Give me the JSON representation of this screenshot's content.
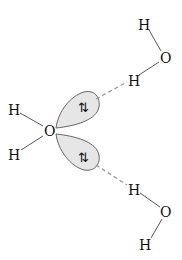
{
  "diagram": {
    "type": "hydrogen-bonding",
    "colors": {
      "lobe_fill": "#e6e6e6",
      "lobe_stroke": "#555555",
      "bond": "#555555",
      "hydrogen_bond": "#9a9a9a",
      "text": "#111111"
    },
    "central_water": {
      "oxygen": "O",
      "h_upper": "H",
      "h_lower": "H",
      "lone_pairs": [
        {
          "position": "upper",
          "electrons": "⇅"
        },
        {
          "position": "lower",
          "electrons": "⇅"
        }
      ]
    },
    "top_water": {
      "h_top": "H",
      "oxygen": "O",
      "h_bonded": "H"
    },
    "bottom_water": {
      "h_bonded": "H",
      "oxygen": "O",
      "h_bottom": "H"
    }
  }
}
